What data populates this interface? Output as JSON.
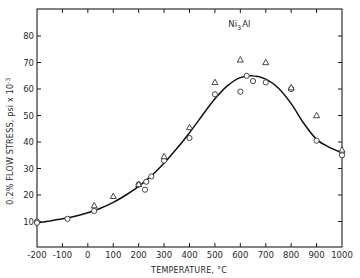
{
  "chart_data": {
    "type": "scatter",
    "title": "",
    "annotation": {
      "text": "Ni",
      "subscript": "3",
      "suffix": "Al",
      "x": 600,
      "y": 84
    },
    "xlabel": "TEMPERATURE, °C",
    "ylabel": "0.2% FLOW STRESS, psi x 10",
    "ylabel_superscript": "-3",
    "xlim": [
      -200,
      1000
    ],
    "ylim": [
      0,
      90
    ],
    "x_ticks": [
      -200,
      -100,
      0,
      100,
      200,
      300,
      400,
      500,
      600,
      700,
      800,
      900,
      1000
    ],
    "x_tick_labels": [
      "-200",
      "-100",
      "0",
      "100",
      "200",
      "300",
      "400",
      "500",
      "600",
      "700",
      "800",
      "900",
      "1000"
    ],
    "y_ticks": [
      10,
      20,
      30,
      40,
      50,
      60,
      70,
      80
    ],
    "y_tick_labels": [
      "10",
      "20",
      "30",
      "40",
      "50",
      "60",
      "70",
      "80"
    ],
    "grid": false,
    "legend": null,
    "series": [
      {
        "name": "circles",
        "marker": "circle",
        "x": [
          -200,
          -200,
          -80,
          25,
          200,
          225,
          230,
          250,
          300,
          400,
          500,
          600,
          625,
          650,
          700,
          800,
          900,
          1000,
          1000
        ],
        "y": [
          10,
          9.5,
          11,
          14,
          24,
          22,
          25,
          27,
          33,
          41.5,
          58,
          59,
          65,
          63,
          62.5,
          60,
          40.5,
          36,
          35
        ]
      },
      {
        "name": "triangles",
        "marker": "triangle",
        "x": [
          25,
          100,
          200,
          300,
          400,
          500,
          600,
          700,
          800,
          900,
          1000
        ],
        "y": [
          16,
          19.5,
          24,
          34.5,
          45.5,
          62.5,
          71,
          70,
          60.5,
          50,
          37
        ]
      },
      {
        "name": "fit-curve",
        "marker": "line",
        "x": [
          -200,
          -150,
          -100,
          -50,
          0,
          50,
          100,
          150,
          200,
          250,
          300,
          350,
          400,
          450,
          500,
          550,
          600,
          650,
          700,
          750,
          800,
          850,
          900,
          950,
          1000
        ],
        "y": [
          9.5,
          10.2,
          11.0,
          12.0,
          13.3,
          15.0,
          17.2,
          20.0,
          23.3,
          27.2,
          32.0,
          37.5,
          43.5,
          50.0,
          56.3,
          61.3,
          64.3,
          65.0,
          63.7,
          60.3,
          54.5,
          47.0,
          41.0,
          38.0,
          36.0
        ]
      }
    ]
  }
}
